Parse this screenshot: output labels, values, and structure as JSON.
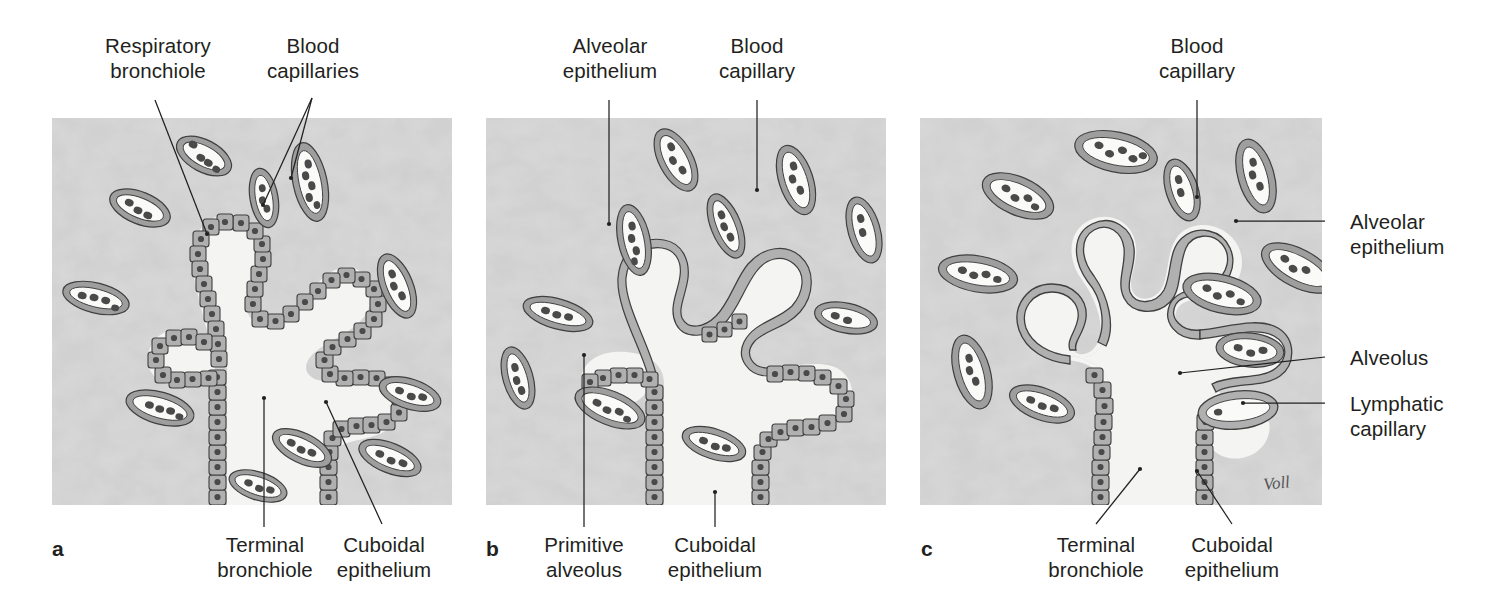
{
  "figure": {
    "signature": "Voll",
    "background_color": "#ffffff",
    "tissue_color": "#cfcfcf",
    "lumen_color": "#f4f4f2",
    "cell_fill": "#b8b8b8",
    "nucleus_color": "#4a4a4a",
    "outline_color": "#3a3a3a",
    "text_color": "#231f20"
  },
  "panels": [
    {
      "letter": "a",
      "stage": "Canalicular / saccular stage",
      "labels": [
        {
          "name": "respiratory-bronchiole",
          "text": "Respiratory\nbronchiole"
        },
        {
          "name": "blood-capillaries",
          "text": "Blood\ncapillaries"
        },
        {
          "name": "terminal-bronchiole",
          "text": "Terminal\nbronchiole"
        },
        {
          "name": "cuboidal-epithelium",
          "text": "Cuboidal\nepithelium"
        }
      ]
    },
    {
      "letter": "b",
      "stage": "Saccular / early alveolar stage",
      "labels": [
        {
          "name": "alveolar-epithelium",
          "text": "Alveolar\nepithelium"
        },
        {
          "name": "blood-capillary",
          "text": "Blood\ncapillary"
        },
        {
          "name": "primitive-alveolus",
          "text": "Primitive\nalveolus"
        },
        {
          "name": "cuboidal-epithelium",
          "text": "Cuboidal\nepithelium"
        }
      ]
    },
    {
      "letter": "c",
      "stage": "Mature alveolar stage",
      "labels": [
        {
          "name": "blood-capillary",
          "text": "Blood\ncapillary"
        },
        {
          "name": "alveolar-epithelium",
          "text": "Alveolar\nepithelium"
        },
        {
          "name": "alveolus",
          "text": "Alveolus"
        },
        {
          "name": "lymphatic-capillary",
          "text": "Lymphatic\ncapillary"
        },
        {
          "name": "terminal-bronchiole",
          "text": "Terminal\nbronchiole"
        },
        {
          "name": "cuboidal-epithelium",
          "text": "Cuboidal\nepithelium"
        }
      ]
    }
  ]
}
